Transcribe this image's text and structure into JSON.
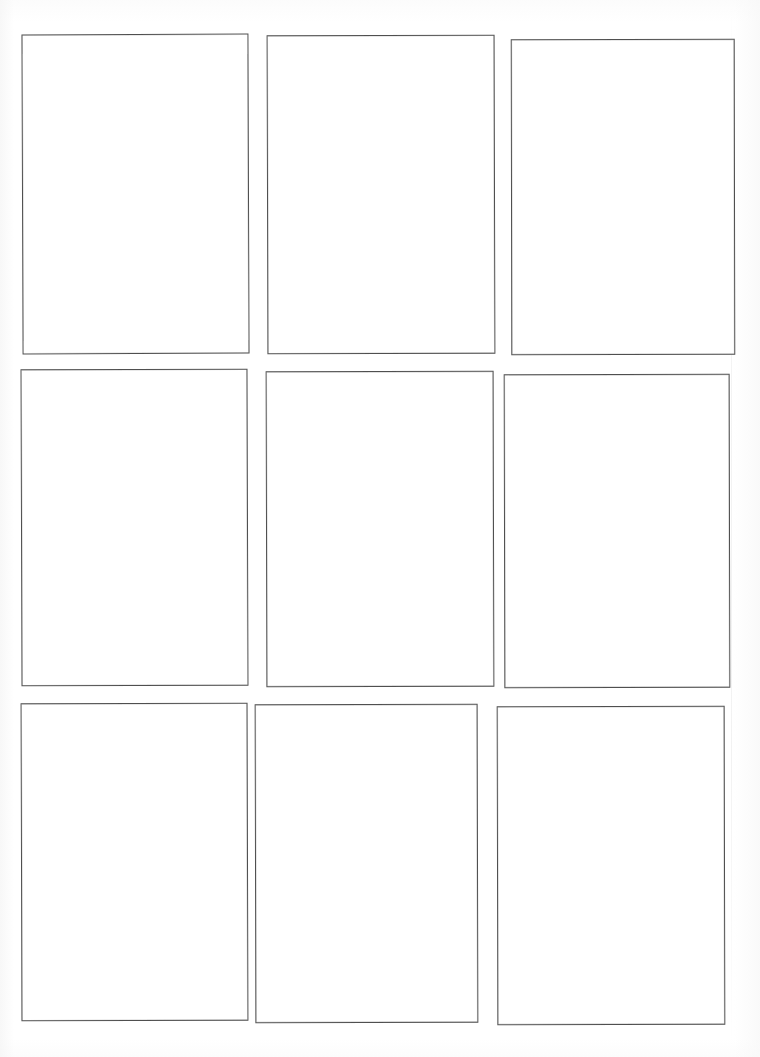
{
  "document": {
    "kind": "scanned-sheet",
    "title": "Blank nine-panel grid sheet",
    "page_width_px": 760,
    "page_height_px": 1057,
    "background_color": "#ffffff",
    "ink_color": "#4f4f4f",
    "border_width_px": 1,
    "panel_count": 9,
    "grid_rows": 3,
    "grid_columns": 3,
    "panels_are_empty": true
  },
  "grid": {
    "rows": [
      {
        "row_label": "row-1",
        "cells": [
          {
            "id": "r1c1",
            "content": "",
            "x": 22,
            "y": 34,
            "width": 227,
            "height": 320
          },
          {
            "id": "r1c2",
            "content": "",
            "x": 267,
            "y": 35,
            "width": 228,
            "height": 319
          },
          {
            "id": "r1c3",
            "content": "",
            "x": 511,
            "y": 39,
            "width": 224,
            "height": 316
          }
        ]
      },
      {
        "row_label": "row-2",
        "cells": [
          {
            "id": "r2c1",
            "content": "",
            "x": 21,
            "y": 369,
            "width": 227,
            "height": 317
          },
          {
            "id": "r2c2",
            "content": "",
            "x": 266,
            "y": 371,
            "width": 228,
            "height": 316
          },
          {
            "id": "r2c3",
            "content": "",
            "x": 504,
            "y": 374,
            "width": 226,
            "height": 314
          }
        ]
      },
      {
        "row_label": "row-3",
        "cells": [
          {
            "id": "r3c1",
            "content": "",
            "x": 21,
            "y": 703,
            "width": 227,
            "height": 318
          },
          {
            "id": "r3c2",
            "content": "",
            "x": 255,
            "y": 704,
            "width": 223,
            "height": 319
          },
          {
            "id": "r3c3",
            "content": "",
            "x": 497,
            "y": 706,
            "width": 228,
            "height": 319
          }
        ]
      }
    ]
  },
  "margins": {
    "top_px": 34,
    "left_px": 21,
    "right_px": 25,
    "bottom_px": 32
  }
}
